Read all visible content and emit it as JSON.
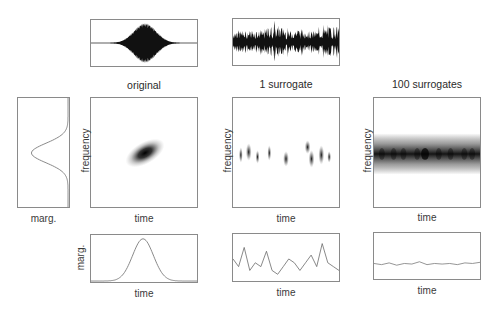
{
  "figure": {
    "columns": [
      {
        "title": "original",
        "tf_ylabel": "frequency",
        "tf_xlabel": "time",
        "marg_ylabel": "marg.",
        "marg_xlabel": "time"
      },
      {
        "title": "1 surrogate",
        "tf_ylabel": "frequency",
        "tf_xlabel": "time",
        "marg_xlabel": "time"
      },
      {
        "title": "100 surrogates",
        "tf_ylabel": "frequency",
        "tf_xlabel": "time",
        "marg_xlabel": "time"
      }
    ],
    "freq_marginal": {
      "xlabel": "marg."
    },
    "colors": {
      "ink": "#111111",
      "frame": "#8a8a8a",
      "line": "#777777",
      "text": "#333333"
    }
  },
  "chart_data": [
    {
      "type": "line",
      "title": "original signal",
      "description": "Gaussian-enveloped chirp waveform, centered burst"
    },
    {
      "type": "line",
      "title": "1 surrogate signal",
      "description": "noise-like waveform with irregular amplitude"
    },
    {
      "type": "heatmap",
      "title": "original",
      "xlabel": "time",
      "ylabel": "frequency",
      "description": "single tilted gaussian blob at center"
    },
    {
      "type": "heatmap",
      "title": "1 surrogate",
      "xlabel": "time",
      "ylabel": "frequency",
      "description": "scattered short blobs along center frequency band"
    },
    {
      "type": "heatmap",
      "title": "100 surrogates",
      "xlabel": "time",
      "ylabel": "frequency",
      "description": "continuous horizontal band at center frequency"
    },
    {
      "type": "line",
      "title": "frequency marginal",
      "xlabel": "marg.",
      "description": "gaussian peak at mid frequency"
    },
    {
      "type": "line",
      "title": "original time marginal",
      "xlabel": "time",
      "ylabel": "marg.",
      "x": [
        0,
        0.1,
        0.2,
        0.3,
        0.4,
        0.5,
        0.6,
        0.7,
        0.8,
        0.9,
        1
      ],
      "values": [
        0,
        0.01,
        0.05,
        0.25,
        0.7,
        1,
        0.7,
        0.25,
        0.05,
        0.01,
        0
      ]
    },
    {
      "type": "line",
      "title": "1 surrogate time marginal",
      "xlabel": "time",
      "values": [
        0.5,
        0.3,
        0.8,
        0.2,
        0.4,
        0.3,
        0.7,
        0.2,
        0.1,
        0.3,
        0.5,
        0.4,
        0.2,
        0.4,
        0.6,
        0.3,
        0.9,
        0.4,
        0.3,
        0.2
      ]
    },
    {
      "type": "line",
      "title": "100 surrogates time marginal",
      "xlabel": "time",
      "values": [
        0.27,
        0.25,
        0.28,
        0.24,
        0.27,
        0.26,
        0.3,
        0.25,
        0.27,
        0.26,
        0.27,
        0.25,
        0.28,
        0.27,
        0.29
      ]
    }
  ]
}
